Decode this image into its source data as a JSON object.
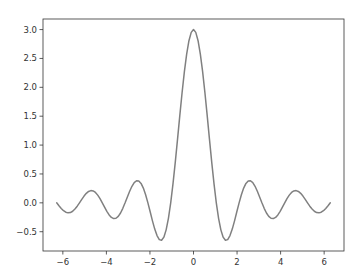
{
  "chart_data": {
    "type": "line",
    "title": "",
    "xlabel": "",
    "ylabel": "",
    "function": "sin(3x)/x",
    "xlim": [
      -6.912,
      6.912
    ],
    "ylim": [
      -0.834,
      3.183
    ],
    "grid": false,
    "legend": null,
    "line_color": "#808080",
    "xticks": [
      -6,
      -4,
      -2,
      0,
      2,
      4,
      6
    ],
    "xtick_labels": [
      "−6",
      "−4",
      "−2",
      "0",
      "2",
      "4",
      "6"
    ],
    "yticks": [
      -0.5,
      0.0,
      0.5,
      1.0,
      1.5,
      2.0,
      2.5,
      3.0
    ],
    "ytick_labels": [
      "−0.5",
      "0.0",
      "0.5",
      "1.0",
      "1.5",
      "2.0",
      "2.5",
      "3.0"
    ],
    "series": [
      {
        "name": "sin(3x)/x",
        "x_step": 0.10472,
        "x_start": -6.28319,
        "y": [
          0,
          -0.05,
          -0.0968,
          -0.1355,
          -0.1622,
          -0.1736,
          -0.1682,
          -0.1458,
          -0.1079,
          -0.0579,
          0,
          0.0602,
          0.1169,
          0.1644,
          0.1974,
          0.2122,
          0.2064,
          0.1797,
          0.1336,
          0.072,
          0,
          -0.0757,
          -0.1477,
          -0.2088,
          -0.2523,
          -0.2728,
          -0.2671,
          -0.2341,
          -0.1754,
          -0.0952,
          0,
          0.1018,
          0.2005,
          0.2861,
          0.3493,
          0.382,
          0.3784,
          0.3359,
          0.2551,
          0.1405,
          0,
          -0.1553,
          -0.3118,
          -0.4544,
          -0.5676,
          -0.6366,
          -0.6487,
          -0.5943,
          -0.4678,
          -0.2683,
          0,
          0.3279,
          0.7016,
          1.1037,
          1.5137,
          1.9099,
          2.2705,
          2.5752,
          2.8065,
          2.9509,
          3.0,
          2.9509,
          2.8065,
          2.5752,
          2.2705,
          1.9099,
          1.5137,
          1.1037,
          0.7016,
          0.3279,
          0,
          -0.2683,
          -0.4678,
          -0.5943,
          -0.6487,
          -0.6366,
          -0.5676,
          -0.4544,
          -0.3118,
          -0.1553,
          0,
          0.1405,
          0.2551,
          0.3359,
          0.3784,
          0.382,
          0.3493,
          0.2861,
          0.2005,
          0.1018,
          0,
          -0.0952,
          -0.1754,
          -0.2341,
          -0.2671,
          -0.2728,
          -0.2523,
          -0.2088,
          -0.1477,
          -0.0757,
          0,
          0.072,
          0.1336,
          0.1797,
          0.2064,
          0.2122,
          0.1974,
          0.1644,
          0.1169,
          0.0602,
          0,
          -0.0579,
          -0.1079,
          -0.1458,
          -0.1682,
          -0.1736,
          -0.1622,
          -0.1355,
          -0.0968,
          -0.05,
          0
        ]
      }
    ]
  }
}
